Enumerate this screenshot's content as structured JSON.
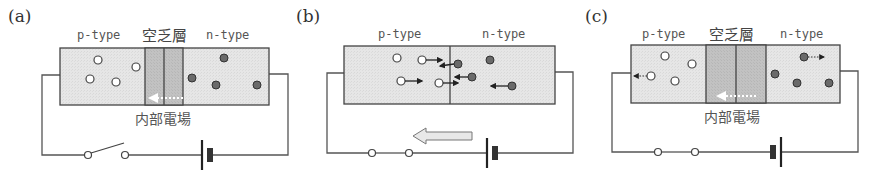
{
  "colors": {
    "wire": "#555555",
    "box_border": "#444444",
    "region_fill": "#e4e4e4",
    "depletion_fill": "#bdbdbd",
    "electron_fill": "#6a6a6a",
    "hole_fill": "#ffffff",
    "field_arrow": "#ffffff",
    "current_arrow_fill": "#e8e8e8"
  },
  "panels": [
    {
      "id": "a",
      "label": "(a)",
      "p_label": "p-type",
      "depletion_label": "空乏層",
      "n_label": "n-type",
      "field_label": "内部電場",
      "depletion_neg": [
        "-",
        "-",
        "-"
      ],
      "depletion_pos": [
        "+",
        "+",
        "+"
      ],
      "switch_state": "open",
      "battery_orientation": "long-plate-left"
    },
    {
      "id": "b",
      "label": "(b)",
      "p_label": "p-type",
      "n_label": "n-type",
      "switch_state": "closed",
      "battery_orientation": "long-plate-left",
      "current_arrow_direction": "left"
    },
    {
      "id": "c",
      "label": "(c)",
      "p_label": "p-type",
      "depletion_label": "空乏層",
      "n_label": "n-type",
      "field_label": "内部電場",
      "depletion_neg": [
        "- -",
        "- -",
        "- -"
      ],
      "depletion_pos": [
        "+ +",
        "+ +",
        "+ +"
      ],
      "switch_state": "closed",
      "battery_orientation": "long-plate-right"
    }
  ]
}
